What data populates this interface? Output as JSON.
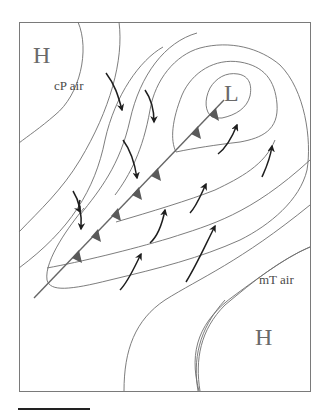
{
  "diagram": {
    "type": "surface weather map",
    "labels": {
      "high_nw": "H",
      "high_se": "H",
      "low": "L",
      "cold_air_mass": "cP air",
      "warm_air_mass": "mT air"
    },
    "features": {
      "front_type": "cold front",
      "front_triangles_count": 7,
      "wind_arrows_count": 11,
      "isobars": "closed contours around L, curved lines around both H centers"
    },
    "colors": {
      "isobar": "#6e6e6e",
      "front": "#5a5a5a",
      "wind_arrow": "#1e1e1e",
      "label": "#6a6a6a",
      "background": "#ffffff"
    }
  }
}
